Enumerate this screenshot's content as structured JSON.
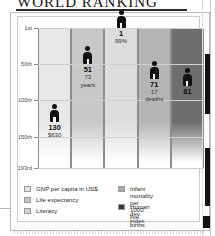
{
  "document": {
    "title": "WORLD RANKING"
  },
  "chart_data": {
    "type": "bar",
    "title": "WORLD RANKING",
    "axis_caption": "Position in World",
    "xlabel": "",
    "ylabel": "Position in World",
    "grid": true,
    "legend_position": "bottom",
    "y_axis": {
      "ticks": [
        "1st",
        "50th",
        "100th",
        "150th",
        "193rd"
      ],
      "tick_values": [
        1,
        50,
        100,
        150,
        193
      ],
      "min": 1,
      "max": 193,
      "inverted": true
    },
    "categories": [
      "GNP per capita in US$",
      "Life expectancy",
      "Literacy",
      "Infant mortality per 1000 live births",
      "Human dev. index"
    ],
    "values": [
      130,
      51,
      1,
      71,
      81
    ],
    "points": [
      {
        "category": "GNP per capita in US$",
        "rank": 130,
        "rank_label": "130",
        "detail": "$630",
        "detail_unit": ""
      },
      {
        "category": "Life expectancy",
        "rank": 51,
        "rank_label": "51",
        "detail": "73",
        "detail_unit": "years"
      },
      {
        "category": "Literacy",
        "rank": 1,
        "rank_label": "1",
        "detail": "99%",
        "detail_unit": ""
      },
      {
        "category": "Infant mortality per 1000 live births",
        "rank": 71,
        "rank_label": "71",
        "detail": "17",
        "detail_unit": "deaths"
      },
      {
        "category": "Human dev. index",
        "rank": 81,
        "rank_label": "81",
        "detail": "",
        "detail_unit": ""
      }
    ],
    "colors": [
      "#e8e8e8",
      "#c8c8c8",
      "#dcdcdc",
      "#b4b4b4",
      "#6e6e6e"
    ]
  },
  "legend": {
    "left_column": [
      {
        "label": "GNP per capita in US$",
        "swatch": "#e4e4e4"
      },
      {
        "label": "Life expectancy",
        "swatch": "#c6c6c6"
      },
      {
        "label": "Literacy",
        "swatch": "#d8d8d8"
      }
    ],
    "right_column": [
      {
        "label_line1": "Infant mortality per",
        "label_line2": "1000 live births",
        "swatch": "#a9a9a9"
      },
      {
        "label_line1": "Human dev. index",
        "label_line2": "",
        "swatch": "#3a3a3a"
      }
    ]
  }
}
